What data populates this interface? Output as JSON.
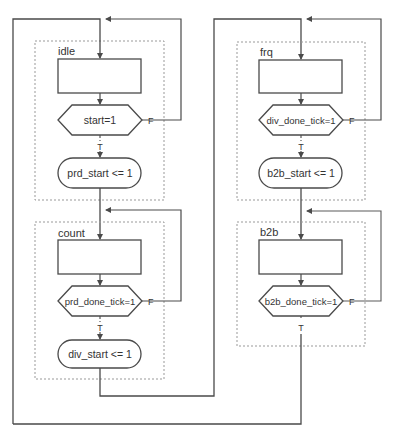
{
  "diagram": {
    "type": "ASM chart",
    "colors": {
      "line": "#4a4a4a",
      "dashed": "#999999",
      "text": "#333333",
      "background": "#ffffff"
    },
    "states": [
      {
        "name": "idle",
        "decision": "start=1",
        "action": "prd_start <= 1",
        "false_label": "F",
        "true_label": "T"
      },
      {
        "name": "count",
        "decision": "prd_done_tick=1",
        "action": "div_start <= 1",
        "false_label": "F",
        "true_label": "T"
      },
      {
        "name": "frq",
        "decision": "div_done_tick=1",
        "action": "b2b_start <= 1",
        "false_label": "F",
        "true_label": "T"
      },
      {
        "name": "b2b",
        "decision": "b2b_done_tick=1",
        "false_label": "F",
        "true_label": "T"
      }
    ]
  }
}
